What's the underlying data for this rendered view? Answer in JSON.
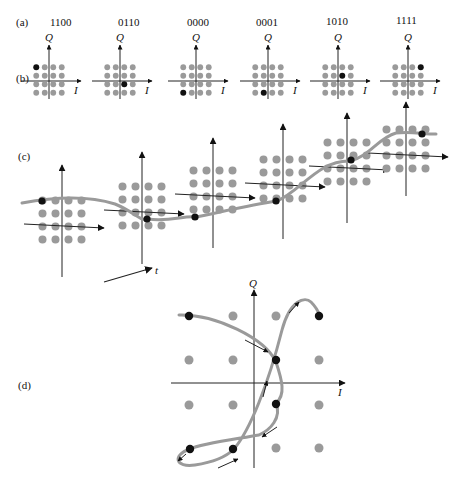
{
  "figure": {
    "panel_labels": {
      "a": "(a)",
      "b": "(b)",
      "c": "(c)",
      "d": "(d)"
    },
    "axis_labels": {
      "q": "Q",
      "i": "I",
      "t": "t"
    },
    "colors": {
      "dot": "#9a9a9a",
      "highlight": "#111111",
      "axis": "#222222",
      "trajectory": "#9a9a9a",
      "background": "#ffffff"
    }
  },
  "panel_a": {
    "codes": [
      "1100",
      "0110",
      "0000",
      "0001",
      "1010",
      "1111"
    ]
  },
  "panel_b": {
    "constellations": [
      {
        "code": "1100",
        "cx": 49,
        "cy": 81,
        "highlight": [
          0,
          0
        ]
      },
      {
        "code": "0110",
        "cx": 120,
        "cy": 81,
        "highlight": [
          2,
          2
        ]
      },
      {
        "code": "0000",
        "cx": 196,
        "cy": 81,
        "highlight": [
          0,
          3
        ]
      },
      {
        "code": "0001",
        "cx": 268,
        "cy": 81,
        "highlight": [
          1,
          3
        ]
      },
      {
        "code": "1010",
        "cx": 338,
        "cy": 81,
        "highlight": [
          2,
          1
        ]
      },
      {
        "code": "1111",
        "cx": 408,
        "cy": 81,
        "highlight": [
          3,
          0
        ]
      }
    ]
  },
  "panel_c": {
    "description": "Sequence of 16-QAM constellations along time axis with a smooth trajectory through selected symbols",
    "time_axis_label": "t"
  },
  "panel_d": {
    "description": "Enlarged 16-QAM constellation with continuous signal trajectory and direction arrows through symbols"
  }
}
